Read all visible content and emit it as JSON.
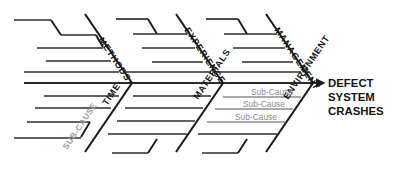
{
  "diagram": {
    "type": "fishbone-ishikawa-cause-and-effect",
    "background_color": "#ffffff",
    "line_color": "#1b1b1b",
    "muted_color": "#8d8d8d",
    "head": {
      "lines": [
        "DEFECT",
        "SYSTEM",
        "CRASHES"
      ],
      "line1": "DEFECT",
      "line2": "SYSTEM",
      "line3": "CRASHES"
    },
    "categories": {
      "methods": "METHODS",
      "time": "TIME",
      "experience": "EXPERIENCE",
      "materials": "MATERIALS",
      "management": "MANAGEMENT",
      "environment": "ENVIRONMENT"
    },
    "subcauses": {
      "rotated_left": "SUB-CAUSE",
      "env_1": "Sub-Cause",
      "env_2": "Sub-Cause",
      "env_3": "Sub-Cause"
    }
  }
}
